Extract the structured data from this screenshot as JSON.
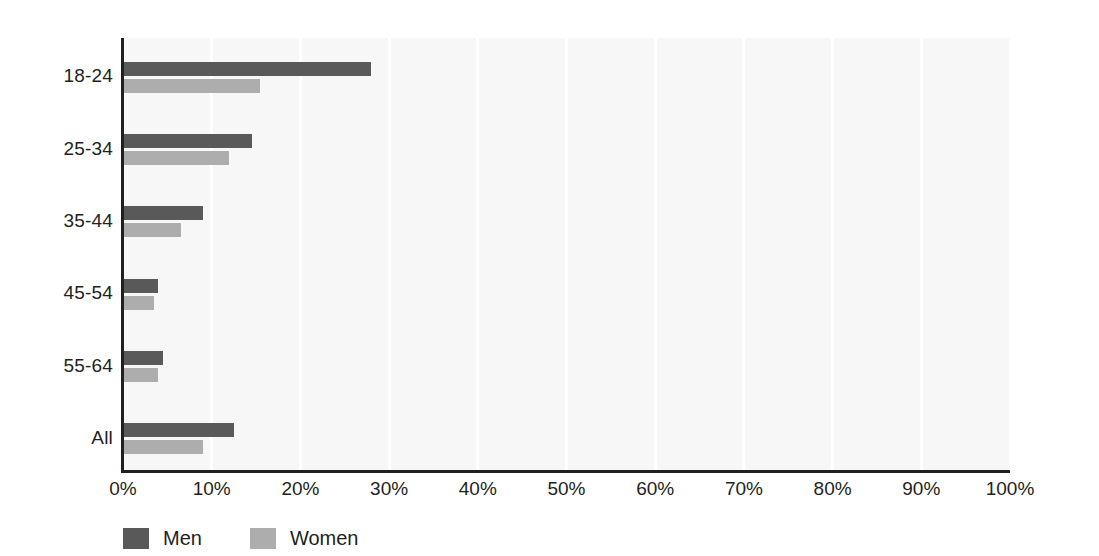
{
  "chart_data": {
    "type": "bar",
    "orientation": "horizontal",
    "title": "",
    "subtitle": "",
    "xlabel": "",
    "ylabel": "",
    "xlim": [
      0,
      100
    ],
    "grid": true,
    "grid_axis": "x",
    "legend_position": "bottom-left",
    "categories": [
      "18-24",
      "25-34",
      "35-44",
      "45-54",
      "55-64",
      "All"
    ],
    "xticks": [
      0,
      10,
      20,
      30,
      40,
      50,
      60,
      70,
      80,
      90,
      100
    ],
    "xtick_labels": [
      "0%",
      "10%",
      "20%",
      "30%",
      "40%",
      "50%",
      "60%",
      "70%",
      "80%",
      "90%",
      "100%"
    ],
    "series": [
      {
        "name": "Men",
        "color": "#595959",
        "values": [
          28.0,
          14.5,
          9.0,
          4.0,
          4.5,
          12.5
        ]
      },
      {
        "name": "Women",
        "color": "#adadad",
        "values": [
          15.5,
          12.0,
          6.5,
          3.5,
          4.0,
          9.0
        ]
      }
    ]
  },
  "legend": {
    "items": [
      {
        "label": "Men",
        "color": "#595959"
      },
      {
        "label": "Women",
        "color": "#adadad"
      }
    ]
  },
  "style": {
    "plot_background": "#f7f7f7",
    "gridline_color": "#ffffff",
    "axis_color": "#231f20",
    "text_color": "#231f20",
    "page_background": "#ffffff"
  }
}
